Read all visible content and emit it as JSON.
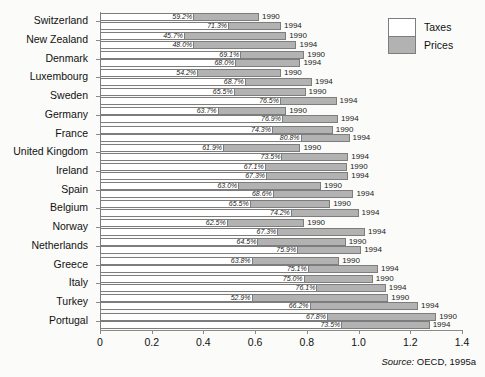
{
  "legend": {
    "position": "top-right",
    "entries": [
      {
        "label": "Taxes",
        "color": "#ffffff"
      },
      {
        "label": "Prices",
        "color": "#b2b2b2"
      }
    ]
  },
  "source": {
    "prefix": "Source:",
    "text": " OECD, 1995a"
  },
  "chart_data": {
    "type": "bar",
    "orientation": "horizontal",
    "stacked": true,
    "title": "",
    "xlabel": "",
    "ylabel": "",
    "xlim": [
      0,
      1.4
    ],
    "xticks": [
      "0",
      "0.2",
      "0.4",
      "0.6",
      "0.8",
      "1.0",
      "1.2",
      "1.4"
    ],
    "xtickvalues": [
      0,
      0.2,
      0.4,
      0.6,
      0.8,
      1.0,
      1.2,
      1.4
    ],
    "grid": false,
    "categories": [
      "Switzerland",
      "New Zealand",
      "Denmark",
      "Luxembourg",
      "Sweden",
      "Germany",
      "France",
      "United Kingdom",
      "Ireland",
      "Spain",
      "Belgium",
      "Norway",
      "Netherlands",
      "Greece",
      "Italy",
      "Turkey",
      "Portugal"
    ],
    "series": [
      {
        "name": "Taxes",
        "color": "#ffffff"
      },
      {
        "name": "Prices",
        "color": "#b2b2b2"
      }
    ],
    "bars": [
      {
        "category": "Switzerland",
        "year": "1990",
        "total": 0.615,
        "tax_pct": "59.2%",
        "tax_share": 0.592
      },
      {
        "category": "Switzerland",
        "year": "1994",
        "total": 0.7,
        "tax_pct": "71.3%",
        "tax_share": 0.713
      },
      {
        "category": "New Zealand",
        "year": "1990",
        "total": 0.72,
        "tax_pct": "45.7%",
        "tax_share": 0.457
      },
      {
        "category": "New Zealand",
        "year": "1994",
        "total": 0.76,
        "tax_pct": "48.0%",
        "tax_share": 0.48
      },
      {
        "category": "Denmark",
        "year": "1990",
        "total": 0.79,
        "tax_pct": "69.1%",
        "tax_share": 0.691
      },
      {
        "category": "Denmark",
        "year": "1994",
        "total": 0.775,
        "tax_pct": "68.0%",
        "tax_share": 0.68
      },
      {
        "category": "Luxembourg",
        "year": "1990",
        "total": 0.7,
        "tax_pct": "54.2%",
        "tax_share": 0.542
      },
      {
        "category": "Luxembourg",
        "year": "1994",
        "total": 0.82,
        "tax_pct": "68.7%",
        "tax_share": 0.687
      },
      {
        "category": "Sweden",
        "year": "1990",
        "total": 0.795,
        "tax_pct": "65.5%",
        "tax_share": 0.655
      },
      {
        "category": "Sweden",
        "year": "1994",
        "total": 0.915,
        "tax_pct": "76.5%",
        "tax_share": 0.765
      },
      {
        "category": "Germany",
        "year": "1990",
        "total": 0.72,
        "tax_pct": "63.7%",
        "tax_share": 0.637
      },
      {
        "category": "Germany",
        "year": "1994",
        "total": 0.92,
        "tax_pct": "76.9%",
        "tax_share": 0.769
      },
      {
        "category": "France",
        "year": "1990",
        "total": 0.9,
        "tax_pct": "74.3%",
        "tax_share": 0.743
      },
      {
        "category": "France",
        "year": "1994",
        "total": 0.965,
        "tax_pct": "80.8%",
        "tax_share": 0.808
      },
      {
        "category": "United Kingdom",
        "year": "1990",
        "total": 0.775,
        "tax_pct": "61.9%",
        "tax_share": 0.619
      },
      {
        "category": "United Kingdom",
        "year": "1994",
        "total": 0.96,
        "tax_pct": "73.5%",
        "tax_share": 0.735
      },
      {
        "category": "Ireland",
        "year": "1990",
        "total": 0.955,
        "tax_pct": "67.1%",
        "tax_share": 0.671
      },
      {
        "category": "Ireland",
        "year": "1994",
        "total": 0.96,
        "tax_pct": "67.3%",
        "tax_share": 0.673
      },
      {
        "category": "Spain",
        "year": "1990",
        "total": 0.855,
        "tax_pct": "63.0%",
        "tax_share": 0.63
      },
      {
        "category": "Spain",
        "year": "1994",
        "total": 0.98,
        "tax_pct": "68.6%",
        "tax_share": 0.686
      },
      {
        "category": "Belgium",
        "year": "1990",
        "total": 0.89,
        "tax_pct": "65.5%",
        "tax_share": 0.655
      },
      {
        "category": "Belgium",
        "year": "1994",
        "total": 1.0,
        "tax_pct": "74.2%",
        "tax_share": 0.742
      },
      {
        "category": "Norway",
        "year": "1990",
        "total": 0.79,
        "tax_pct": "62.5%",
        "tax_share": 0.625
      },
      {
        "category": "Norway",
        "year": "1994",
        "total": 1.025,
        "tax_pct": "67.3%",
        "tax_share": 0.673
      },
      {
        "category": "Netherlands",
        "year": "1990",
        "total": 0.95,
        "tax_pct": "64.5%",
        "tax_share": 0.645
      },
      {
        "category": "Netherlands",
        "year": "1994",
        "total": 1.01,
        "tax_pct": "75.9%",
        "tax_share": 0.759
      },
      {
        "category": "Greece",
        "year": "1990",
        "total": 0.925,
        "tax_pct": "63.8%",
        "tax_share": 0.638
      },
      {
        "category": "Greece",
        "year": "1994",
        "total": 1.075,
        "tax_pct": "75.1%",
        "tax_share": 0.751
      },
      {
        "category": "Italy",
        "year": "1990",
        "total": 1.055,
        "tax_pct": "75.0%",
        "tax_share": 0.75
      },
      {
        "category": "Italy",
        "year": "1994",
        "total": 1.105,
        "tax_pct": "76.1%",
        "tax_share": 0.761
      },
      {
        "category": "Turkey",
        "year": "1990",
        "total": 1.115,
        "tax_pct": "52.9%",
        "tax_share": 0.529
      },
      {
        "category": "Turkey",
        "year": "1994",
        "total": 1.23,
        "tax_pct": "66.2%",
        "tax_share": 0.662
      },
      {
        "category": "Portugal",
        "year": "1990",
        "total": 1.3,
        "tax_pct": "67.8%",
        "tax_share": 0.678
      },
      {
        "category": "Portugal",
        "year": "1994",
        "total": 1.275,
        "tax_pct": "73.5%",
        "tax_share": 0.735
      }
    ]
  }
}
